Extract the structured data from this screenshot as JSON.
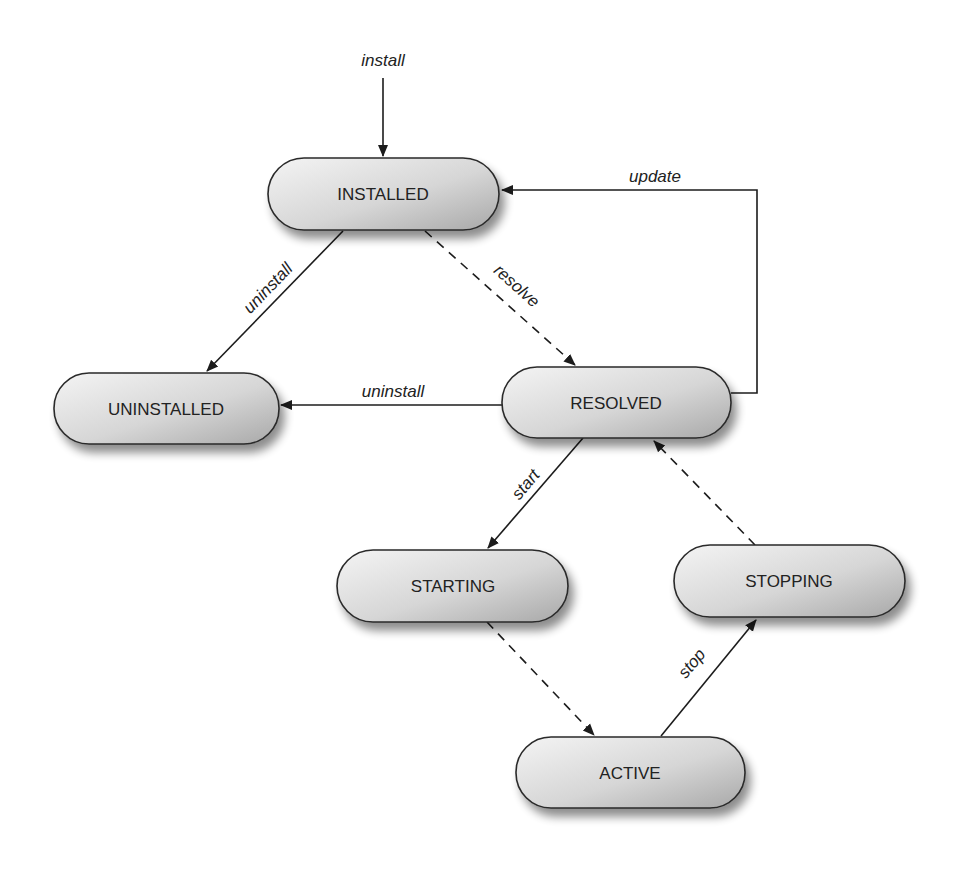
{
  "diagram": {
    "nodes": [
      {
        "id": "installed",
        "label": "INSTALLED"
      },
      {
        "id": "uninstalled",
        "label": "UNINSTALLED"
      },
      {
        "id": "resolved",
        "label": "RESOLVED"
      },
      {
        "id": "starting",
        "label": "STARTING"
      },
      {
        "id": "stopping",
        "label": "STOPPING"
      },
      {
        "id": "active",
        "label": "ACTIVE"
      }
    ],
    "edges": [
      {
        "from": "(entry)",
        "to": "installed",
        "label": "install",
        "style": "solid"
      },
      {
        "from": "installed",
        "to": "uninstalled",
        "label": "uninstall",
        "style": "solid"
      },
      {
        "from": "installed",
        "to": "resolved",
        "label": "resolve",
        "style": "dashed"
      },
      {
        "from": "resolved",
        "to": "installed",
        "label": "update",
        "style": "solid"
      },
      {
        "from": "resolved",
        "to": "uninstalled",
        "label": "uninstall",
        "style": "solid"
      },
      {
        "from": "resolved",
        "to": "starting",
        "label": "start",
        "style": "solid"
      },
      {
        "from": "starting",
        "to": "active",
        "label": "",
        "style": "dashed"
      },
      {
        "from": "active",
        "to": "stopping",
        "label": "stop",
        "style": "solid"
      },
      {
        "from": "stopping",
        "to": "resolved",
        "label": "",
        "style": "dashed"
      }
    ]
  }
}
